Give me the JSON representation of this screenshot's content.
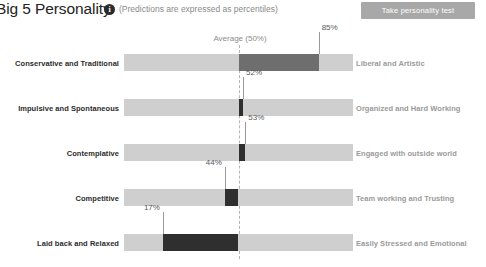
{
  "header": {
    "title": "Big 5 Personality",
    "info_icon": "info-icon",
    "subtitle": "(Predictions are expressed as percentiles)",
    "cta_label": "Take personality test"
  },
  "chart_data": {
    "type": "bar",
    "title": "Big 5 Personality",
    "subtitle": "(Predictions are expressed as percentiles)",
    "orientation": "horizontal-diverging",
    "axis_label": "Average (50%)",
    "xlabel": "",
    "ylabel": "",
    "xlim": [
      0,
      100
    ],
    "center": 50,
    "grid": false,
    "legend": false,
    "unit": "percentile",
    "categories": [
      "Conservative and Traditional",
      "Impulsive and Spontaneous",
      "Contemplative",
      "Competitive",
      "Laid back and Relaxed"
    ],
    "opposite_categories": [
      "Liberal and Artistic",
      "Organized and Hard Working",
      "Engaged with outside world",
      "Team working and Trusting",
      "Easily Stressed and Emotional"
    ],
    "values": [
      85,
      52,
      53,
      44,
      17
    ],
    "value_labels": [
      "85%",
      "52%",
      "53%",
      "44%",
      "17%"
    ],
    "rows": [
      {
        "left_label": "Conservative and Traditional",
        "right_label": "Liberal and Artistic",
        "value": 85,
        "value_label": "85%"
      },
      {
        "left_label": "Impulsive and Spontaneous",
        "right_label": "Organized and Hard Working",
        "value": 52,
        "value_label": "52%"
      },
      {
        "left_label": "Contemplative",
        "right_label": "Engaged with outside world",
        "value": 53,
        "value_label": "53%"
      },
      {
        "left_label": "Competitive",
        "right_label": "Team working and Trusting",
        "value": 44,
        "value_label": "44%"
      },
      {
        "left_label": "Laid back and Relaxed",
        "right_label": "Easily Stressed and Emotional",
        "value": 17,
        "value_label": "17%"
      }
    ]
  },
  "colors": {
    "track": "#cfcfcf",
    "fill_dark": "#2f2f2f",
    "fill_mid": "#6e6e6e",
    "cta_background": "#a8a8a8",
    "center_line": "#b4b4b4",
    "left_label_text": "#2b2b2b",
    "right_label_text": "#9a9a9a"
  }
}
